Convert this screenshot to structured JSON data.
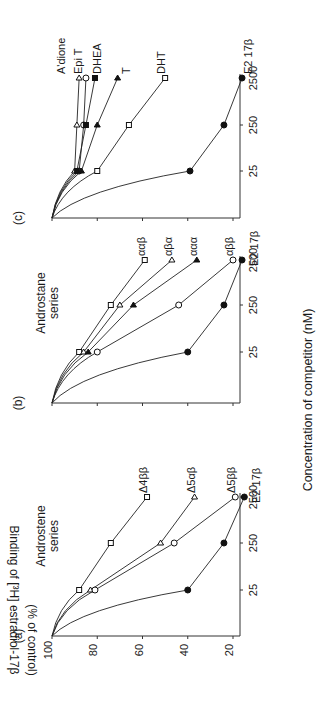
{
  "figure": {
    "orientation": "rotated-90-ccw",
    "y_axis_label_line1": "Binding of [³H] estradiol-17β",
    "y_axis_label_line2": "(% of control)",
    "x_axis_label": "Concentration of competitor (nM)",
    "y_ticks": [
      "100",
      "80",
      "60",
      "40",
      "20"
    ],
    "x_ticks": [
      "25",
      "250",
      "2500"
    ]
  },
  "chart_data": [
    {
      "type": "line",
      "panel": "(a)",
      "title": "Androstene series",
      "xlabel": "Concentration of competitor (nM)",
      "ylabel": "Binding of [3H] estradiol-17β (% of control)",
      "x_scale": "log",
      "x": [
        25,
        250,
        2500
      ],
      "ylim": [
        10,
        100
      ],
      "grid": false,
      "series": [
        {
          "name": "Δ4ββ",
          "marker": "open-square",
          "values": [
            88,
            74,
            58
          ]
        },
        {
          "name": "Δ5αβ",
          "marker": "open-triangle",
          "values": [
            83,
            52,
            37
          ]
        },
        {
          "name": "Δ5ββ",
          "marker": "open-circle",
          "values": [
            81,
            46,
            19
          ]
        },
        {
          "name": "E2 17β",
          "marker": "filled-circle",
          "values": [
            40,
            24,
            15
          ]
        }
      ]
    },
    {
      "type": "line",
      "panel": "(b)",
      "title": "Androstane series",
      "xlabel": "Concentration of competitor (nM)",
      "ylabel": "Binding of [3H] estradiol-17β (% of control)",
      "x_scale": "log",
      "x": [
        25,
        250,
        2500
      ],
      "ylim": [
        10,
        100
      ],
      "grid": false,
      "series": [
        {
          "name": "ααβ",
          "marker": "open-square",
          "values": [
            88,
            74,
            59
          ]
        },
        {
          "name": "αβα",
          "marker": "open-triangle",
          "values": [
            86,
            70,
            47
          ]
        },
        {
          "name": "ααα",
          "marker": "filled-triangle",
          "values": [
            84,
            64,
            36
          ]
        },
        {
          "name": "αββ",
          "marker": "open-circle",
          "values": [
            80,
            44,
            20
          ]
        },
        {
          "name": "E2 17β",
          "marker": "filled-circle",
          "values": [
            40,
            24,
            16
          ]
        }
      ]
    },
    {
      "type": "line",
      "panel": "(c)",
      "title": "",
      "xlabel": "Concentration of competitor (nM)",
      "ylabel": "Binding of [3H] estradiol-17β (% of control)",
      "x_scale": "log",
      "x": [
        25,
        250,
        2500
      ],
      "ylim": [
        10,
        100
      ],
      "grid": false,
      "series": [
        {
          "name": "A'dione",
          "marker": "open-triangle",
          "values": [
            90,
            89,
            88
          ]
        },
        {
          "name": "Epi T",
          "marker": "open-circle",
          "values": [
            88,
            86,
            85
          ]
        },
        {
          "name": "DHEA",
          "marker": "filled-square",
          "values": [
            89,
            85,
            81
          ]
        },
        {
          "name": "T",
          "marker": "filled-triangle",
          "values": [
            87,
            80,
            71
          ]
        },
        {
          "name": "DHT",
          "marker": "open-square",
          "values": [
            80,
            66,
            50
          ]
        },
        {
          "name": "E2 17β",
          "marker": "filled-circle",
          "values": [
            39,
            24,
            16
          ]
        }
      ]
    }
  ]
}
